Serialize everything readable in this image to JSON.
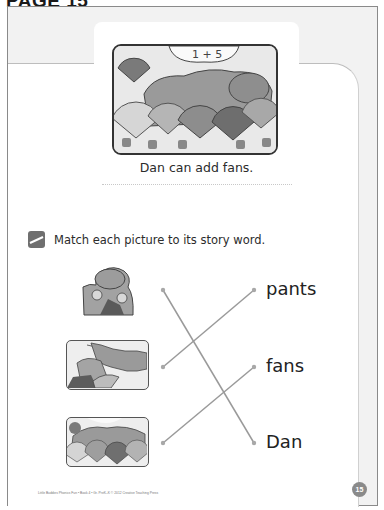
{
  "page": {
    "heading": "PAGE 15",
    "page_number": "15",
    "footer": "Little Buddies Phonics Fun • Book 4 • Gr. PreK–K © 2012 Creative Teaching Press"
  },
  "story": {
    "illustration": {
      "description": "Dan the hippo reclining on pillows while mice hold fans",
      "sign_text": "1 + 5"
    },
    "caption": "Dan can add fans."
  },
  "activity": {
    "icon": "pencil-icon",
    "instruction": "Match each picture to its story word.",
    "pictures": [
      {
        "id": "hippo-with-mice",
        "description": "Dan the hippo with mice"
      },
      {
        "id": "pants-on-line",
        "description": "Pants hanging on a clothesline"
      },
      {
        "id": "hippo-with-fans",
        "description": "Hippo surrounded by fans"
      }
    ],
    "words": [
      "pants",
      "fans",
      "Dan"
    ],
    "matches": [
      {
        "picture": 0,
        "word": 2
      },
      {
        "picture": 1,
        "word": 0
      },
      {
        "picture": 2,
        "word": 1
      }
    ]
  },
  "colors": {
    "line": "#9a9a9a",
    "sheet_bg": "#f2f2f2",
    "panel_bg": "#ffffff",
    "badge": "#8a8a8a"
  }
}
